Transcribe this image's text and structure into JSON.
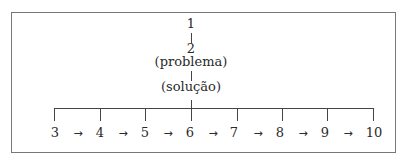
{
  "diagram": {
    "top": {
      "node1": "1",
      "node2": "2",
      "problem_label": "(problema)",
      "solution_label": "(solução)"
    },
    "sequence": [
      "3",
      "4",
      "5",
      "6",
      "7",
      "8",
      "9",
      "10"
    ],
    "arrow": "→",
    "colors": {
      "line": "#444444",
      "frame": "#777777",
      "text": "#2a2a2a"
    }
  }
}
